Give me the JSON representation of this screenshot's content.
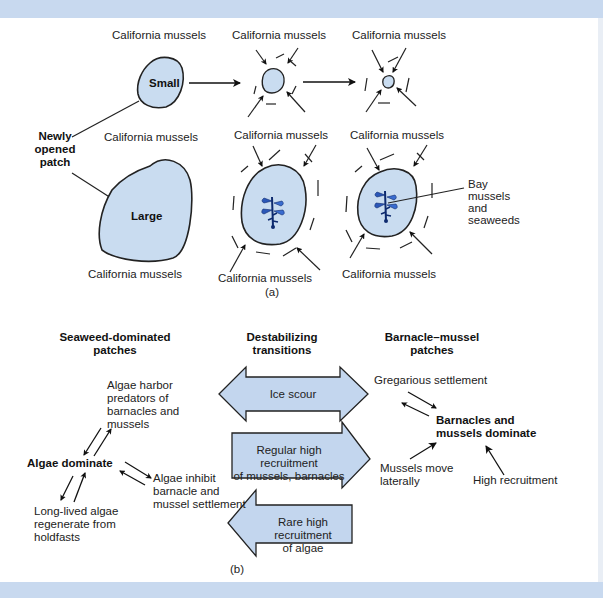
{
  "panel_a": {
    "caption": "(a)",
    "top_row": {
      "label_california_1": "California mussels",
      "label_california_2": "California mussels",
      "label_california_3": "California mussels",
      "patch_small": "Small"
    },
    "newly_opened_patch": "Newly\nopened\npatch",
    "bottom_row": {
      "label_california_top_1": "California mussels",
      "label_california_top_2": "California mussels",
      "label_california_top_3": "California mussels",
      "patch_large": "Large",
      "label_california_bottom_1": "California mussels",
      "label_california_bottom_2": "California mussels",
      "label_california_bottom_3": "California mussels",
      "bay_mussels": "Bay\nmussels\nand\nseaweeds"
    }
  },
  "panel_b": {
    "caption": "(b)",
    "headers": {
      "seaweed": "Seaweed-dominated\npatches",
      "destabilizing": "Destabilizing\ntransitions",
      "barnacle": "Barnacle–mussel\npatches"
    },
    "seaweed_side": {
      "algae_dominate": "Algae dominate",
      "harbor_predators": "Algae harbor\npredators of\nbarnacles and\nmussels",
      "inhibit_settlement": "Algae inhibit\nbarnacle and\nmussel settlement",
      "long_lived": "Long-lived algae\nregenerate from\nholdfasts"
    },
    "transitions": {
      "ice_scour": "Ice scour",
      "regular_recruitment": "Regular high recruitment\nof mussels, barnacles",
      "rare_recruitment": "Rare high recruitment\nof algae"
    },
    "barnacle_side": {
      "dominate": "Barnacles and\nmussels dominate",
      "gregarious": "Gregarious settlement",
      "move_laterally": "Mussels move\nlaterally",
      "high_recruitment": "High recruitment"
    }
  },
  "colors": {
    "patch_fill": "#c9dcf0",
    "arrow_fill": "#c3d6ee",
    "band": "#c8d9ef",
    "seaweed": "#2b57b8"
  }
}
